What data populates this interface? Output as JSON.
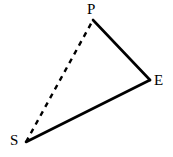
{
  "figure": {
    "type": "geometry-diagram",
    "width": 173,
    "height": 157,
    "background_color": "#ffffff",
    "stroke_color": "#000000",
    "stroke_width": 2.6,
    "vertices": [
      {
        "id": "P",
        "label": "P",
        "x": 93,
        "y": 20
      },
      {
        "id": "E",
        "label": "E",
        "x": 150,
        "y": 80
      },
      {
        "id": "S",
        "label": "S",
        "x": 26,
        "y": 142
      }
    ],
    "edges": [
      {
        "id": "PE",
        "from": "P",
        "to": "E",
        "style": "solid"
      },
      {
        "id": "SE",
        "from": "S",
        "to": "E",
        "style": "solid"
      },
      {
        "id": "SP",
        "from": "S",
        "to": "P",
        "style": "dashed",
        "dash_length": 5,
        "dash_gap": 5
      }
    ],
    "labels": {
      "P": "P",
      "E": "E",
      "S": "S"
    }
  }
}
